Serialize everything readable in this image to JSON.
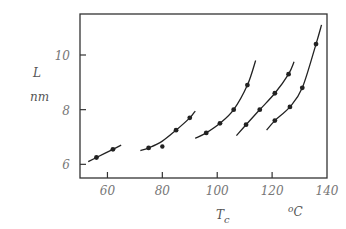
{
  "chart_data": {
    "type": "scatter",
    "title": "",
    "xlabel": "T_c",
    "xlabel_unit": "oC",
    "ylabel": "L",
    "ylabel_unit": "nm",
    "xlim": [
      50,
      140
    ],
    "ylim": [
      5.5,
      11.5
    ],
    "x_ticks": [
      60,
      80,
      100,
      120,
      140
    ],
    "y_ticks": [
      6,
      8,
      10
    ],
    "grid": false,
    "legend": null,
    "series": [
      {
        "name": "series-1",
        "points": [
          [
            56,
            6.25
          ],
          [
            62,
            6.55
          ]
        ],
        "curve": [
          [
            53,
            6.1
          ],
          [
            56,
            6.25
          ],
          [
            62,
            6.55
          ],
          [
            65,
            6.7
          ]
        ]
      },
      {
        "name": "series-2",
        "points": [
          [
            75,
            6.6
          ],
          [
            85,
            7.25
          ],
          [
            90,
            7.7
          ]
        ],
        "outliers": [
          [
            80,
            6.65
          ]
        ],
        "curve": [
          [
            72,
            6.5
          ],
          [
            75,
            6.6
          ],
          [
            80,
            6.85
          ],
          [
            85,
            7.25
          ],
          [
            90,
            7.7
          ],
          [
            92,
            7.95
          ]
        ]
      },
      {
        "name": "series-3",
        "points": [
          [
            96,
            7.15
          ],
          [
            101,
            7.5
          ],
          [
            106,
            8.0
          ],
          [
            111,
            8.9
          ]
        ],
        "curve": [
          [
            92,
            6.95
          ],
          [
            96,
            7.15
          ],
          [
            101,
            7.5
          ],
          [
            106,
            8.0
          ],
          [
            111,
            8.9
          ],
          [
            114,
            9.8
          ]
        ]
      },
      {
        "name": "series-4",
        "points": [
          [
            110.5,
            7.45
          ],
          [
            115.5,
            8.0
          ],
          [
            121,
            8.6
          ],
          [
            126,
            9.3
          ]
        ],
        "curve": [
          [
            107,
            7.05
          ],
          [
            110.5,
            7.45
          ],
          [
            115.5,
            8.0
          ],
          [
            121,
            8.6
          ],
          [
            126,
            9.3
          ],
          [
            128,
            9.75
          ]
        ]
      },
      {
        "name": "series-5",
        "points": [
          [
            121,
            7.6
          ],
          [
            126.5,
            8.1
          ],
          [
            131,
            8.8
          ],
          [
            136,
            10.4
          ]
        ],
        "curve": [
          [
            118,
            7.25
          ],
          [
            121,
            7.6
          ],
          [
            126.5,
            8.1
          ],
          [
            131,
            8.8
          ],
          [
            136,
            10.4
          ],
          [
            138,
            11.1
          ]
        ]
      }
    ]
  },
  "axes": {
    "y_label": "L",
    "y_unit": "nm",
    "x_label": "T",
    "x_label_sub": "c",
    "x_unit": "oC",
    "x_tick_labels": [
      "60",
      "80",
      "100",
      "120",
      "140"
    ],
    "y_tick_labels": [
      "6",
      "8",
      "10"
    ]
  }
}
